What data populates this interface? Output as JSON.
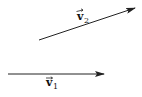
{
  "diagram": {
    "type": "vector-diagram",
    "vectors": [
      {
        "id": "v1",
        "label": "v",
        "subscript": "1",
        "start": [
          8,
          74
        ],
        "end": [
          104,
          74
        ],
        "label_pos": [
          46,
          84
        ]
      },
      {
        "id": "v2",
        "label": "v",
        "subscript": "2",
        "start": [
          39,
          40
        ],
        "end": [
          135,
          8
        ],
        "label_pos": [
          77,
          20
        ]
      }
    ],
    "colors": {
      "line": "#222222",
      "background": "#ffffff"
    }
  }
}
